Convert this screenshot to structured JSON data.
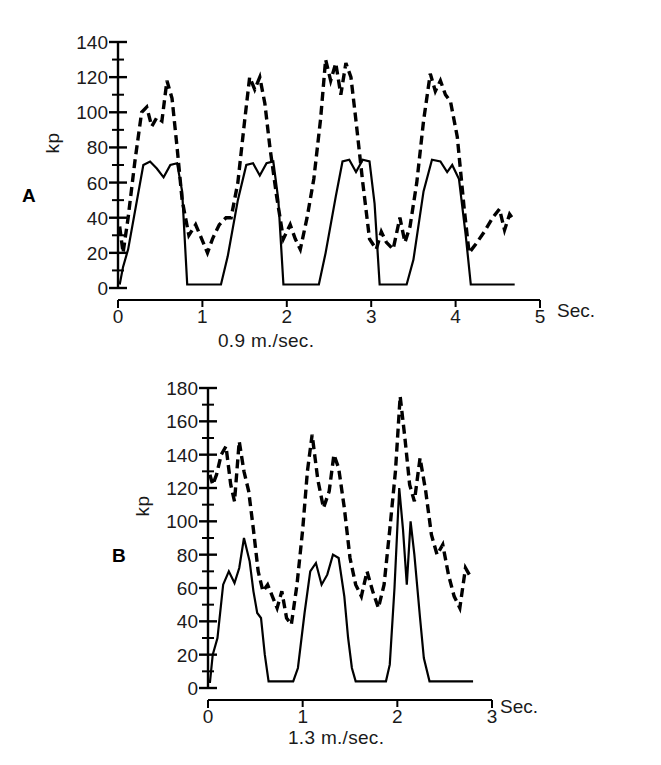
{
  "figure": {
    "background": "#ffffff",
    "line_color": "#000000"
  },
  "panels": [
    {
      "id": "A",
      "label": "A",
      "y_axis_unit": "kp",
      "x_axis_unit": "Sec.",
      "speed_caption": "0.9 m./sec.",
      "y_ticks": [
        0,
        20,
        40,
        60,
        80,
        100,
        120,
        140
      ],
      "x_ticks": [
        0,
        1,
        2,
        3,
        4,
        5
      ]
    },
    {
      "id": "B",
      "label": "B",
      "y_axis_unit": "kp",
      "x_axis_unit": "Sec.",
      "speed_caption": "1.3 m./sec.",
      "y_ticks": [
        0,
        20,
        40,
        60,
        80,
        100,
        120,
        140,
        160,
        180
      ],
      "x_ticks": [
        0,
        1,
        2,
        3
      ]
    }
  ],
  "chart_data": [
    {
      "type": "line",
      "title": "A",
      "xlabel": "Sec.",
      "ylabel": "kp",
      "annotation": "0.9 m./sec.",
      "xlim": [
        0,
        5
      ],
      "ylim": [
        0,
        140
      ],
      "xticks": [
        0,
        1,
        2,
        3,
        4,
        5
      ],
      "yticks": [
        0,
        20,
        40,
        60,
        80,
        100,
        120,
        140
      ],
      "minor_ytick_step": 10,
      "grid": false,
      "legend": "none",
      "series": [
        {
          "name": "solid",
          "style": "solid",
          "color": "#000000",
          "x": [
            0.02,
            0.06,
            0.12,
            0.3,
            0.38,
            0.46,
            0.54,
            0.62,
            0.7,
            0.76,
            0.82,
            1.22,
            1.3,
            1.42,
            1.52,
            1.6,
            1.68,
            1.76,
            1.84,
            1.9,
            1.96,
            2.38,
            2.46,
            2.58,
            2.66,
            2.74,
            2.82,
            2.9,
            2.98,
            3.04,
            3.1,
            3.42,
            3.5,
            3.62,
            3.72,
            3.82,
            3.9,
            3.96,
            4.04,
            4.12,
            4.18,
            4.7
          ],
          "y": [
            2,
            12,
            22,
            70,
            72,
            68,
            63,
            70,
            71,
            55,
            2,
            2,
            18,
            50,
            70,
            71,
            64,
            71,
            72,
            50,
            2,
            2,
            20,
            52,
            72,
            73,
            66,
            73,
            72,
            48,
            2,
            2,
            16,
            55,
            73,
            72,
            66,
            70,
            62,
            30,
            2,
            2
          ]
        },
        {
          "name": "dashed",
          "style": "dashed",
          "color": "#000000",
          "x": [
            0.02,
            0.06,
            0.12,
            0.2,
            0.28,
            0.34,
            0.4,
            0.46,
            0.52,
            0.58,
            0.64,
            0.7,
            0.76,
            0.84,
            0.92,
            1.0,
            1.06,
            1.12,
            1.2,
            1.28,
            1.34,
            1.42,
            1.5,
            1.56,
            1.62,
            1.68,
            1.74,
            1.8,
            1.88,
            1.96,
            2.04,
            2.1,
            2.16,
            2.24,
            2.32,
            2.4,
            2.46,
            2.52,
            2.58,
            2.64,
            2.7,
            2.76,
            2.82,
            2.9,
            2.98,
            3.06,
            3.12,
            3.18,
            3.26,
            3.34,
            3.4,
            3.46,
            3.54,
            3.62,
            3.7,
            3.76,
            3.82,
            3.88,
            3.94,
            4.02,
            4.1,
            4.16,
            4.24,
            4.34,
            4.44,
            4.52,
            4.58,
            4.64,
            4.7
          ],
          "y": [
            35,
            20,
            40,
            72,
            100,
            103,
            92,
            97,
            95,
            118,
            108,
            80,
            50,
            30,
            36,
            27,
            20,
            28,
            36,
            40,
            40,
            60,
            95,
            120,
            113,
            120,
            105,
            80,
            52,
            28,
            36,
            28,
            22,
            40,
            62,
            96,
            130,
            118,
            128,
            110,
            128,
            120,
            95,
            60,
            28,
            22,
            32,
            26,
            22,
            40,
            26,
            35,
            60,
            95,
            122,
            112,
            118,
            110,
            106,
            86,
            46,
            20,
            25,
            32,
            40,
            45,
            33,
            42,
            38
          ]
        }
      ]
    },
    {
      "type": "line",
      "title": "B",
      "xlabel": "Sec.",
      "ylabel": "kp",
      "annotation": "1.3 m./sec.",
      "xlim": [
        0,
        3
      ],
      "ylim": [
        0,
        180
      ],
      "xticks": [
        0,
        1,
        2,
        3
      ],
      "yticks": [
        0,
        20,
        40,
        60,
        80,
        100,
        120,
        140,
        160,
        180
      ],
      "minor_ytick_step": 10,
      "grid": false,
      "legend": "none",
      "series": [
        {
          "name": "solid",
          "style": "solid",
          "color": "#000000",
          "x": [
            0.02,
            0.05,
            0.1,
            0.16,
            0.22,
            0.28,
            0.33,
            0.38,
            0.44,
            0.48,
            0.52,
            0.56,
            0.6,
            0.64,
            0.9,
            0.95,
            1.02,
            1.08,
            1.14,
            1.2,
            1.26,
            1.32,
            1.38,
            1.44,
            1.48,
            1.52,
            1.56,
            1.88,
            1.92,
            1.97,
            2.02,
            2.06,
            2.1,
            2.14,
            2.18,
            2.24,
            2.28,
            2.34,
            2.8
          ],
          "y": [
            3,
            20,
            30,
            62,
            70,
            63,
            72,
            90,
            76,
            58,
            45,
            42,
            20,
            4,
            4,
            12,
            45,
            70,
            75,
            62,
            68,
            80,
            78,
            55,
            30,
            12,
            4,
            4,
            14,
            60,
            120,
            95,
            62,
            100,
            80,
            42,
            18,
            4,
            4
          ]
        },
        {
          "name": "dashed",
          "style": "dashed",
          "color": "#000000",
          "x": [
            0.02,
            0.05,
            0.09,
            0.14,
            0.19,
            0.24,
            0.28,
            0.33,
            0.38,
            0.43,
            0.48,
            0.53,
            0.58,
            0.63,
            0.68,
            0.73,
            0.78,
            0.83,
            0.88,
            0.94,
            1.0,
            1.05,
            1.1,
            1.16,
            1.22,
            1.28,
            1.33,
            1.38,
            1.44,
            1.5,
            1.56,
            1.62,
            1.68,
            1.74,
            1.8,
            1.86,
            1.92,
            1.98,
            2.03,
            2.08,
            2.13,
            2.18,
            2.24,
            2.3,
            2.36,
            2.42,
            2.48,
            2.54,
            2.6,
            2.66,
            2.72,
            2.78
          ],
          "y": [
            128,
            122,
            128,
            140,
            145,
            122,
            112,
            148,
            130,
            118,
            95,
            70,
            58,
            62,
            55,
            48,
            58,
            42,
            38,
            62,
            95,
            130,
            152,
            125,
            108,
            118,
            140,
            132,
            108,
            78,
            62,
            55,
            70,
            58,
            48,
            62,
            95,
            130,
            175,
            150,
            122,
            112,
            138,
            118,
            92,
            80,
            86,
            68,
            55,
            48,
            72,
            66
          ]
        }
      ]
    }
  ]
}
